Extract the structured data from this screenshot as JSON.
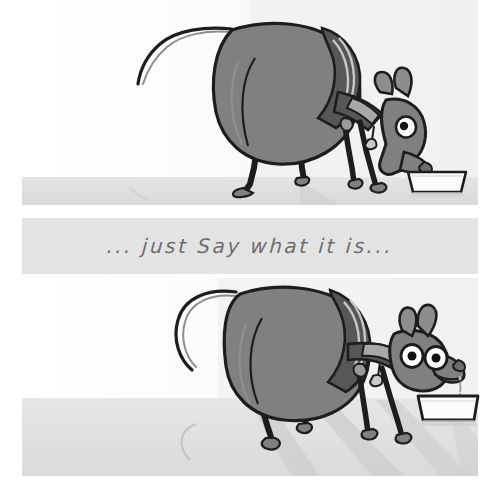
{
  "artwork": {
    "title": "Hungry dog cartoon — two panel comic strip",
    "medium": "pencil and grey wash illustration",
    "panel_count": 2
  },
  "caption": {
    "text": "... just Say what it is...",
    "band_color": "#e3e3e3",
    "ink_color": "#6e6e6e"
  },
  "palette": {
    "page_background": "#ffffff",
    "floor": "#dedede",
    "floor_shadow": "#cfcfcf",
    "wall_tint": "#f2f2f2",
    "dog_body": "#808080",
    "dog_coat_dark": "#575757",
    "dog_coat_stripe": "#a8a8a8",
    "ink": "#1d1d1d",
    "bowl_fill": "#fbfbfb",
    "eye_white": "#ffffff",
    "eye_pupil": "#121212"
  },
  "panels": [
    {
      "id": "panel-top",
      "name": "top-panel",
      "label": "Panel 1",
      "description": "Large pot-bellied greyhound in a striped coat stands with head lowered, muzzle pushed into a white food bowl on the floor. Tail curls up behind.",
      "floor_top": 177,
      "dog": {
        "pose": "head-down-eating",
        "facing": "right",
        "eyes_visible": 1,
        "ears": "floppy-back",
        "coat": "striped jacket",
        "tail": "curled-up"
      },
      "bowl": {
        "state": "muzzle-inside",
        "color": "#fbfbfb"
      }
    },
    {
      "id": "panel-bottom",
      "name": "bottom-panel",
      "label": "Panel 2",
      "description": "Same dog lifts its head, both eyes wide and bulging, mouth open with a drool drip falling toward the bowl, which now sits untouched on the floor. Long diagonal shadows stretch across the ground.",
      "floor_top": 398,
      "dog": {
        "pose": "head-up-expectant",
        "facing": "right",
        "eyes_visible": 2,
        "ears": "perked-up",
        "coat": "striped jacket",
        "tail": "curled-up"
      },
      "bowl": {
        "state": "empty-waiting",
        "color": "#fbfbfb"
      },
      "drool": {
        "visible": true,
        "drops": 2
      }
    }
  ]
}
